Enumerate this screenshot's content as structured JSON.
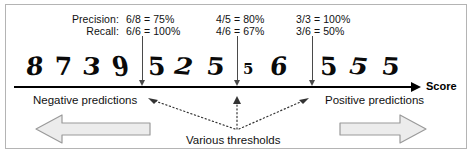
{
  "figure": {
    "axis_label": "Score",
    "accent_color": "#000000",
    "arrow_fill": "#ececec",
    "arrow_stroke": "#9a9a9a",
    "border_color": "#b4b4b4"
  },
  "metrics": {
    "precision_label": "Precision:",
    "recall_label": "Recall:",
    "columns": [
      {
        "precision": "6/8 = 75%",
        "recall": "6/6 = 100%"
      },
      {
        "precision": "4/5 = 80%",
        "recall": "4/6 = 67%"
      },
      {
        "precision": "3/3 = 100%",
        "recall": "3/6 = 50%"
      }
    ]
  },
  "digits": [
    {
      "char": "8",
      "x": 26,
      "style": "sk1"
    },
    {
      "char": "7",
      "x": 55,
      "style": "sk2"
    },
    {
      "char": "3",
      "x": 83,
      "style": "sk3"
    },
    {
      "char": "9",
      "x": 112,
      "style": "sk4"
    },
    {
      "char": "5",
      "x": 148,
      "style": "sk2"
    },
    {
      "char": "2",
      "x": 175,
      "style": "sk5"
    },
    {
      "char": "5",
      "x": 207,
      "style": "sk3"
    },
    {
      "char": "5",
      "x": 243,
      "style": "small"
    },
    {
      "char": "6",
      "x": 270,
      "style": "sk1"
    },
    {
      "char": "5",
      "x": 320,
      "style": "sk2"
    },
    {
      "char": "5",
      "x": 350,
      "style": "sk5"
    },
    {
      "char": "5",
      "x": 382,
      "style": "sk3"
    }
  ],
  "thresholds": {
    "positions": [
      142,
      237,
      312
    ],
    "caption": "Various thresholds"
  },
  "predictions": {
    "negative_label": "Negative predictions",
    "positive_label": "Positive predictions"
  }
}
